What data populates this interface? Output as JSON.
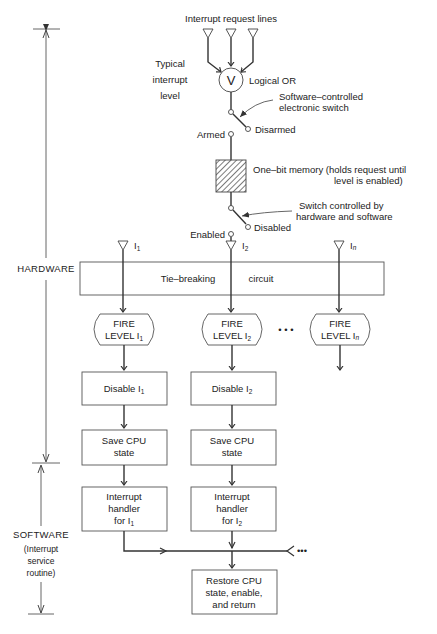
{
  "inputs": {
    "title": "Interrupt request lines"
  },
  "level": {
    "label_line1": "Typical",
    "label_line2": "interrupt",
    "label_line3": "level",
    "or_symbol": "V",
    "or_label": "Logical OR",
    "switch1_line1": "Software–controlled",
    "switch1_line2": "electronic  switch",
    "armed": "Armed",
    "disarmed": "Disarmed",
    "memory_line1": "One–bit  memory  (holds  request  until",
    "memory_line2": "level  is  enabled)",
    "switch2_line1": "Switch  controlled  by",
    "switch2_line2": "hardware  and  software",
    "enabled": "Enabled",
    "disabled": "Disabled"
  },
  "lines": {
    "i1": "I",
    "i1_sub": "1",
    "i2": "I",
    "i2_sub": "2",
    "in": "I",
    "in_sub": "n"
  },
  "tie_breaking": {
    "label_left": "Tie–breaking",
    "label_right": "circuit"
  },
  "fire": [
    {
      "line1": "FIRE",
      "line2": "LEVEL I",
      "sub": "1"
    },
    {
      "line1": "FIRE",
      "line2": "LEVEL I",
      "sub": "2"
    },
    {
      "line1": "FIRE",
      "line2": "LEVEL I",
      "sub": "n"
    }
  ],
  "ellipsis": "• • •",
  "disable": [
    {
      "label": "Disable  I",
      "sub": "1"
    },
    {
      "label": "Disable  I",
      "sub": "2"
    }
  ],
  "save_cpu": [
    {
      "line1": "Save CPU",
      "line2": "state"
    },
    {
      "line1": "Save CPU",
      "line2": "state"
    }
  ],
  "handler": [
    {
      "line1": "Interrupt",
      "line2": "handler",
      "line3": "for  I",
      "sub": "1"
    },
    {
      "line1": "Interrupt",
      "line2": "handler",
      "line3": "for  I",
      "sub": "2"
    }
  ],
  "merge_ellipsis": "•••",
  "restore": {
    "line1": "Restore CPU",
    "line2": "state, enable,",
    "line3": "and return"
  },
  "side": {
    "hardware": "HARDWARE",
    "software": "SOFTWARE",
    "software_note1": "(Interrupt",
    "software_note2": "service",
    "software_note3": "routine)"
  }
}
